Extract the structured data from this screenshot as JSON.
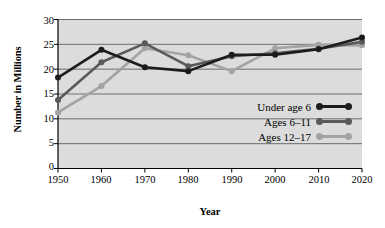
{
  "chart_data": {
    "type": "line",
    "title": "",
    "xlabel": "Year",
    "ylabel": "Number in Millions",
    "x": [
      1950,
      1960,
      1970,
      1980,
      1990,
      2000,
      2010,
      2020
    ],
    "categories": [
      "1950",
      "1960",
      "1970",
      "1980",
      "1990",
      "2000",
      "2010",
      "2020"
    ],
    "xlim": [
      1950,
      2020
    ],
    "ylim": [
      0,
      30
    ],
    "yticks": [
      0,
      5,
      10,
      15,
      20,
      25,
      30
    ],
    "grid": true,
    "legend_position": "inside-right",
    "series": [
      {
        "name": "Under age 6",
        "color": "#1c1c1c",
        "values": [
          18.3,
          23.9,
          20.4,
          19.6,
          22.9,
          22.9,
          24.0,
          26.4
        ]
      },
      {
        "name": "Ages 6–11",
        "color": "#5a5a5a",
        "values": [
          13.8,
          21.4,
          25.2,
          20.6,
          22.6,
          23.2,
          24.1,
          25.5
        ]
      },
      {
        "name": "Ages 12–17",
        "color": "#a3a3a3",
        "values": [
          11.3,
          16.6,
          24.2,
          22.8,
          19.6,
          24.2,
          24.9,
          24.8
        ]
      }
    ]
  },
  "axis": {
    "y_title": "Number in Millions",
    "x_title": "Year",
    "y_tick_labels": [
      "30",
      "25",
      "20",
      "15",
      "10",
      "5",
      "0"
    ],
    "x_tick_labels": [
      "1950",
      "1960",
      "1970",
      "1980",
      "1990",
      "2000",
      "2010",
      "2020"
    ]
  },
  "legend": {
    "items": [
      {
        "label": "Under age 6",
        "color": "#1c1c1c"
      },
      {
        "label": "Ages 6–11",
        "color": "#5a5a5a"
      },
      {
        "label": "Ages 12–17",
        "color": "#a3a3a3"
      }
    ]
  },
  "style": {
    "plot_background": "#dcdcdc",
    "grid_color": "#6e6e6e",
    "axis_color": "#000000",
    "page_background": "#ffffff"
  }
}
